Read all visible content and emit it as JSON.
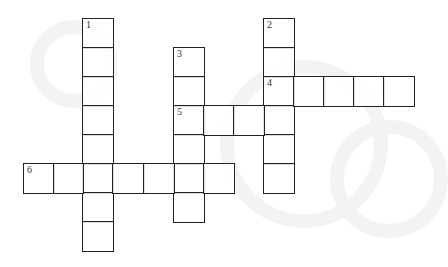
{
  "puzzle": {
    "type": "crossword",
    "cell_size": 30,
    "origin": {
      "x": 23,
      "y": 18
    },
    "colors": {
      "line": "#222222",
      "number": "#333333",
      "background": "#ffffff"
    },
    "words": [
      {
        "number": "1",
        "direction": "down",
        "col": 2,
        "row": 0,
        "length": 8
      },
      {
        "number": "2",
        "direction": "down",
        "col": 8,
        "row": 0,
        "length": 6
      },
      {
        "number": "3",
        "direction": "down",
        "col": 5,
        "row": 1,
        "length": 6
      },
      {
        "number": "4",
        "direction": "across",
        "col": 8,
        "row": 2,
        "length": 5
      },
      {
        "number": "5",
        "direction": "across",
        "col": 5,
        "row": 3,
        "length": 4
      },
      {
        "number": "6",
        "direction": "across",
        "col": 0,
        "row": 5,
        "length": 7
      }
    ]
  }
}
